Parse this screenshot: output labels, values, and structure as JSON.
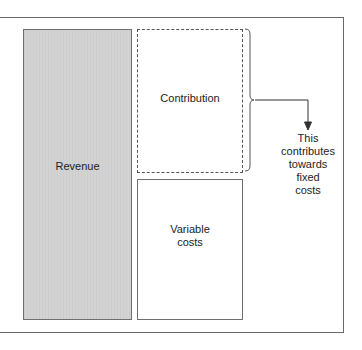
{
  "diagram": {
    "boxes": {
      "revenue": {
        "label": "Revenue"
      },
      "contribution": {
        "label": "Contribution"
      },
      "variable_costs": {
        "label": "Variable costs",
        "lines": [
          "Variable",
          "costs"
        ]
      }
    },
    "annotation": {
      "lines": [
        "This",
        "contributes",
        "towards",
        "fixed",
        "costs"
      ],
      "text": "This contributes towards fixed costs"
    },
    "colors": {
      "revenue_fill": "#d3d3d3",
      "border": "#6e6e6e",
      "frame": "#6a6a6a"
    }
  }
}
